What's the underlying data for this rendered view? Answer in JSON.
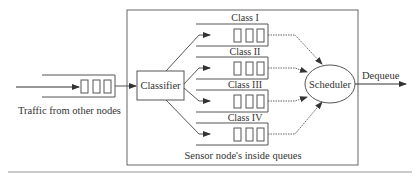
{
  "diagram": {
    "title_box": "Sensor node's inside queues",
    "input_label": "Traffic from other nodes",
    "classifier_label": "Classifier",
    "scheduler_label": "Scheduler",
    "output_label": "Dequeue",
    "classes": [
      {
        "label": "Class I"
      },
      {
        "label": "Class II"
      },
      {
        "label": "Class III"
      },
      {
        "label": "Class IV"
      }
    ],
    "colors": {
      "stroke": "#555555",
      "text": "#333333",
      "background": "#ffffff"
    }
  }
}
